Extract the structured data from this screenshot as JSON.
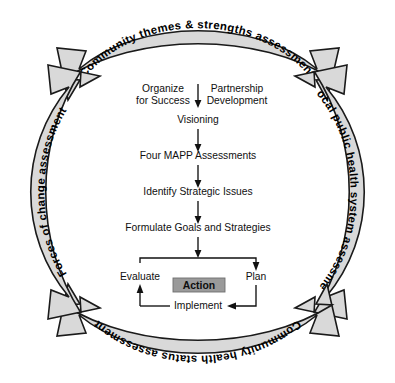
{
  "diagram": {
    "canvas": {
      "width": 395,
      "height": 383
    },
    "colors": {
      "band_fill": "#d9d9d9",
      "band_stroke": "#1a1a1a",
      "action_fill": "#9a9a9a",
      "text": "#101010",
      "background": "#ffffff"
    },
    "bands": {
      "top": {
        "label": "Community themes & strengths assessment",
        "position": "top",
        "arrowheads": "both"
      },
      "right": {
        "label": "Local public health system assessment",
        "position": "right",
        "arrowheads": "both"
      },
      "bottom": {
        "label": "Community health status assessment",
        "position": "bottom",
        "arrowheads": "both"
      },
      "left": {
        "label": "Forces of change assessment",
        "position": "left",
        "arrowheads": "both"
      }
    },
    "flow": {
      "organize": "Organize",
      "organize_line2": "for Success",
      "partnership": "Partnership",
      "partnership_line2": "Development",
      "visioning": "Visioning",
      "assessments": "Four MAPP Assessments",
      "strategic_issues": "Identify Strategic Issues",
      "goals": "Formulate Goals and Strategies"
    },
    "action_cycle": {
      "evaluate": "Evaluate",
      "plan": "Plan",
      "implement": "Implement",
      "action": "Action"
    }
  }
}
